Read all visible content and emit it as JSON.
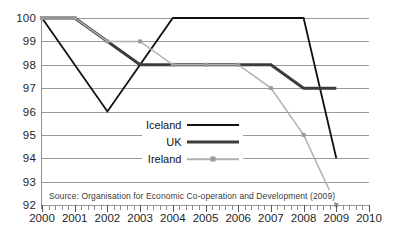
{
  "chart_data": {
    "type": "line",
    "title": "",
    "subtitle": "",
    "xlabel": "",
    "ylabel": "",
    "x": [
      2000,
      2001,
      2002,
      2003,
      2004,
      2005,
      2006,
      2007,
      2008,
      2009,
      2010
    ],
    "xticklabels": [
      "2000",
      "2001",
      "2002",
      "2003",
      "2004",
      "2005",
      "2006",
      "2007",
      "2008",
      "2009",
      "2010"
    ],
    "yticklabels": [
      "92",
      "93",
      "94",
      "95",
      "96",
      "97",
      "98",
      "99",
      "100"
    ],
    "xlim": [
      2000,
      2010
    ],
    "ylim": [
      92,
      100
    ],
    "grid": "horizontal",
    "legend_position": "center",
    "series": [
      {
        "name": "Iceland",
        "color": "#111111",
        "width": 1.8,
        "marker": "none",
        "x": [
          2000,
          2002,
          2004,
          2008,
          2009
        ],
        "values": [
          100,
          96,
          100,
          100,
          94
        ]
      },
      {
        "name": "UK",
        "color": "#3c3c3c",
        "width": 3.0,
        "marker": "none",
        "x": [
          2000,
          2001,
          2003,
          2007,
          2008,
          2009
        ],
        "values": [
          100,
          100,
          98,
          98,
          97,
          97
        ]
      },
      {
        "name": "Ireland",
        "color": "#b0b0b0",
        "width": 1.5,
        "marker": "square",
        "marker_color": "#9a9a9a",
        "x": [
          2000,
          2001,
          2002,
          2003,
          2004,
          2005,
          2006,
          2007,
          2008,
          2009
        ],
        "values": [
          100,
          100,
          99,
          99,
          98,
          98,
          98,
          97,
          95,
          92
        ]
      }
    ],
    "annotations": [
      "Source: Organisation for Economic Co-operation and Development (2009)"
    ]
  },
  "legend": {
    "items": [
      {
        "label": "Iceland"
      },
      {
        "label": "UK"
      },
      {
        "label": "Ireland"
      }
    ]
  },
  "source_note": "Source: Organisation for Economic Co-operation and Development (2009)",
  "axis": {
    "y_ticks": [
      "100",
      "99",
      "98",
      "97",
      "96",
      "95",
      "94",
      "93",
      "92"
    ],
    "x_ticks": [
      "2000",
      "2001",
      "2002",
      "2003",
      "2004",
      "2005",
      "2006",
      "2007",
      "2008",
      "2009",
      "2010"
    ]
  }
}
